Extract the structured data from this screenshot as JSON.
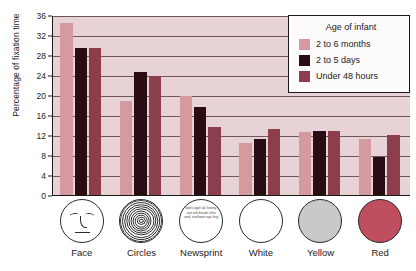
{
  "chart_data": {
    "type": "bar",
    "title": "",
    "xlabel": "",
    "ylabel": "Percentage of fixation time",
    "ylim": [
      0,
      36
    ],
    "yticks": [
      0,
      4,
      8,
      12,
      16,
      20,
      24,
      28,
      32,
      36
    ],
    "grid": true,
    "legend_position": "top-right",
    "legend_title": "Age of infant",
    "categories": [
      "Face",
      "Circles",
      "Newsprint",
      "White",
      "Yellow",
      "Red"
    ],
    "series": [
      {
        "name": "2 to 6 months",
        "color": "#d49a9f",
        "values": [
          34.5,
          18.8,
          19.9,
          10.4,
          12.6,
          11.2
        ]
      },
      {
        "name": "2 to 5 days",
        "color": "#2a0d12",
        "values": [
          29.4,
          24.7,
          17.7,
          11.2,
          12.8,
          7.6
        ]
      },
      {
        "name": "Under 48 hours",
        "color": "#8c3e4c",
        "values": [
          29.4,
          23.9,
          13.7,
          13.2,
          12.8,
          12.1
        ]
      }
    ]
  },
  "icons": {
    "face": {
      "label": "Face",
      "name": "face-icon"
    },
    "circles": {
      "label": "Circles",
      "name": "concentric-circles-icon"
    },
    "newsprint": {
      "label": "Newsprint",
      "name": "newsprint-icon",
      "text": "does appl ud, honey, wat erb bread; who ood, sunflowe ngs hug"
    },
    "white": {
      "label": "White",
      "name": "white-disc-icon",
      "color": "#ffffff"
    },
    "yellow": {
      "label": "Yellow",
      "name": "yellow-disc-icon",
      "color": "#c9cac8"
    },
    "red": {
      "label": "Red",
      "name": "red-disc-icon",
      "color": "#bf4e5f"
    }
  }
}
